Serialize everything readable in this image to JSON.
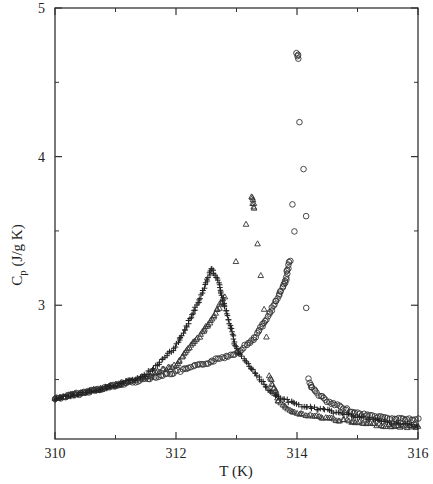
{
  "chart_data": {
    "type": "scatter",
    "title": "",
    "xlabel": "T (K)",
    "ylabel_main": "C",
    "ylabel_sub": "p",
    "ylabel_rest": " (J/g K)",
    "xlim": [
      310,
      316
    ],
    "ylim": [
      2.1,
      5
    ],
    "xticks": [
      310,
      312,
      314,
      316
    ],
    "xtick_labels": [
      "310",
      "312",
      "314",
      "316"
    ],
    "xminor": [
      311,
      313,
      315
    ],
    "yticks": [
      3,
      4,
      5
    ],
    "ytick_labels": [
      "3",
      "4",
      "5"
    ],
    "yminor": [
      2.5,
      3.5,
      4.5
    ],
    "grid": false,
    "legend": "none",
    "series": [
      {
        "name": "circles",
        "marker": "circle",
        "points": [
          [
            310,
            2.37
          ],
          [
            311,
            2.46
          ],
          [
            312,
            2.55
          ],
          [
            312.5,
            2.61
          ],
          [
            313,
            2.68
          ],
          [
            313.3,
            2.78
          ],
          [
            313.5,
            2.91
          ],
          [
            313.65,
            3.02
          ],
          [
            313.8,
            3.15
          ],
          [
            313.88,
            3.3
          ],
          [
            313.95,
            3.5
          ],
          [
            313.93,
            3.68
          ],
          [
            314.0,
            4.7
          ],
          [
            314.02,
            4.66
          ],
          [
            314.05,
            4.23
          ],
          [
            314.1,
            3.92
          ],
          [
            314.15,
            3.6
          ],
          [
            314.15,
            2.98
          ],
          [
            314.2,
            2.5
          ],
          [
            314.25,
            2.44
          ],
          [
            314.5,
            2.35
          ],
          [
            315,
            2.27
          ],
          [
            315.5,
            2.24
          ],
          [
            316,
            2.23
          ]
        ]
      },
      {
        "name": "triangles",
        "marker": "triangle",
        "points": [
          [
            310,
            2.37
          ],
          [
            311,
            2.46
          ],
          [
            311.5,
            2.52
          ],
          [
            312,
            2.6
          ],
          [
            312.5,
            2.85
          ],
          [
            312.8,
            3.05
          ],
          [
            313,
            3.3
          ],
          [
            313.15,
            3.55
          ],
          [
            313.25,
            3.73
          ],
          [
            313.3,
            3.65
          ],
          [
            313.35,
            3.42
          ],
          [
            313.4,
            3.2
          ],
          [
            313.45,
            2.97
          ],
          [
            313.5,
            2.78
          ],
          [
            313.55,
            2.52
          ],
          [
            313.7,
            2.35
          ],
          [
            314,
            2.27
          ],
          [
            314.5,
            2.24
          ],
          [
            315,
            2.21
          ],
          [
            315.5,
            2.19
          ],
          [
            316,
            2.18
          ]
        ]
      },
      {
        "name": "crosses",
        "marker": "cross",
        "points": [
          [
            310,
            2.37
          ],
          [
            311,
            2.46
          ],
          [
            311.5,
            2.53
          ],
          [
            312,
            2.72
          ],
          [
            312.2,
            2.88
          ],
          [
            312.4,
            3.05
          ],
          [
            312.55,
            3.2
          ],
          [
            312.6,
            3.25
          ],
          [
            312.7,
            3.15
          ],
          [
            312.8,
            3.0
          ],
          [
            312.9,
            2.85
          ],
          [
            313,
            2.7
          ],
          [
            313.3,
            2.55
          ],
          [
            313.6,
            2.4
          ],
          [
            314,
            2.33
          ],
          [
            314.5,
            2.29
          ],
          [
            315,
            2.25
          ],
          [
            315.5,
            2.21
          ],
          [
            316,
            2.19
          ]
        ]
      }
    ]
  }
}
